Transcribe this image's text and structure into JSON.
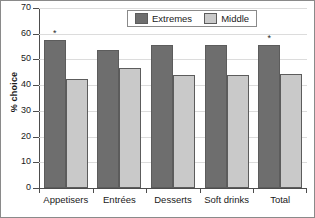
{
  "chart_data": {
    "type": "bar",
    "title": "",
    "xlabel": "",
    "ylabel": "% choice",
    "ylim": [
      0,
      70
    ],
    "yticks": [
      0,
      10,
      20,
      30,
      40,
      50,
      60,
      70
    ],
    "grid": true,
    "legend_position": "top-center",
    "categories": [
      "Appetisers",
      "Entrées",
      "Desserts",
      "Soft drinks",
      "Total"
    ],
    "series": [
      {
        "name": "Extremes",
        "color": "#6e6e6e",
        "values": [
          57.5,
          53.5,
          55.5,
          55.5,
          55.5
        ],
        "significance": [
          "*",
          "",
          "",
          "",
          "*"
        ]
      },
      {
        "name": "Middle",
        "color": "#c9c9c9",
        "values": [
          42.5,
          46.5,
          44.0,
          44.0,
          44.5
        ],
        "significance": [
          "",
          "",
          "",
          "",
          ""
        ]
      }
    ]
  },
  "axes": {
    "y_title": "% choice",
    "y_tick_labels": [
      "70",
      "60",
      "50",
      "40",
      "30",
      "20",
      "10",
      "0"
    ]
  },
  "legend": {
    "entries": [
      {
        "label": "Extremes",
        "swatch": "extremes"
      },
      {
        "label": "Middle",
        "swatch": "middle"
      }
    ]
  }
}
